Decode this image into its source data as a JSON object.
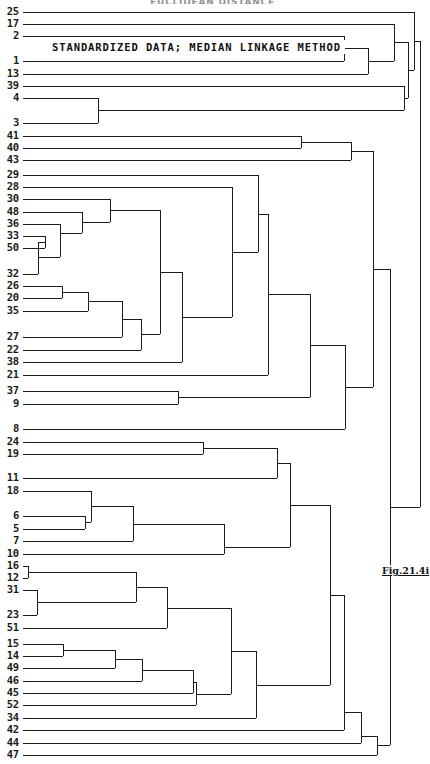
{
  "figure": {
    "top_title": "EUCLIDEAN DISTANCE",
    "subtitle": "STANDARDIZED DATA; MEDIAN LINKAGE METHOD",
    "caption": "Fig.21.4i",
    "line_color": "#1c1c1c",
    "background_color": "#ffffff",
    "text_color": "#111111"
  },
  "chart_data": {
    "type": "dendrogram",
    "title": "EUCLIDEAN DISTANCE",
    "subtitle": "STANDARDIZED DATA; MEDIAN LINKAGE METHOD",
    "xlabel": "Euclidean distance",
    "ylabel": "",
    "orientation": "horizontal",
    "linkage_method": "median",
    "data_transform": "standardized",
    "distance_metric": "euclidean",
    "grid": false,
    "legend": "none",
    "axis_ticks_shown": false,
    "leaf_count": 52,
    "leaves": [
      {
        "label": "25",
        "y": 12
      },
      {
        "label": "17",
        "y": 24
      },
      {
        "label": "2",
        "y": 36
      },
      {
        "label": "1",
        "y": 61
      },
      {
        "label": "13",
        "y": 74
      },
      {
        "label": "39",
        "y": 86
      },
      {
        "label": "4",
        "y": 98
      },
      {
        "label": "3",
        "y": 123
      },
      {
        "label": "41",
        "y": 136
      },
      {
        "label": "40",
        "y": 148
      },
      {
        "label": "43",
        "y": 160
      },
      {
        "label": "29",
        "y": 175
      },
      {
        "label": "28",
        "y": 187
      },
      {
        "label": "30",
        "y": 199
      },
      {
        "label": "48",
        "y": 212
      },
      {
        "label": "36",
        "y": 224
      },
      {
        "label": "33",
        "y": 236
      },
      {
        "label": "50",
        "y": 248
      },
      {
        "label": "32",
        "y": 274
      },
      {
        "label": "26",
        "y": 286
      },
      {
        "label": "20",
        "y": 298
      },
      {
        "label": "35",
        "y": 311
      },
      {
        "label": "27",
        "y": 337
      },
      {
        "label": "22",
        "y": 350
      },
      {
        "label": "38",
        "y": 362
      },
      {
        "label": "21",
        "y": 375
      },
      {
        "label": "37",
        "y": 391
      },
      {
        "label": "9",
        "y": 404
      },
      {
        "label": "8",
        "y": 429
      },
      {
        "label": "24",
        "y": 442
      },
      {
        "label": "19",
        "y": 454
      },
      {
        "label": "11",
        "y": 478
      },
      {
        "label": "18",
        "y": 491
      },
      {
        "label": "6",
        "y": 516
      },
      {
        "label": "5",
        "y": 529
      },
      {
        "label": "7",
        "y": 541
      },
      {
        "label": "10",
        "y": 554
      },
      {
        "label": "16",
        "y": 566
      },
      {
        "label": "12",
        "y": 578
      },
      {
        "label": "31",
        "y": 590
      },
      {
        "label": "23",
        "y": 615
      },
      {
        "label": "51",
        "y": 628
      },
      {
        "label": "15",
        "y": 644
      },
      {
        "label": "14",
        "y": 656
      },
      {
        "label": "49",
        "y": 668
      },
      {
        "label": "46",
        "y": 681
      },
      {
        "label": "45",
        "y": 693
      },
      {
        "label": "52",
        "y": 705
      },
      {
        "label": "34",
        "y": 718
      },
      {
        "label": "42",
        "y": 730
      },
      {
        "label": "44",
        "y": 743
      },
      {
        "label": "47",
        "y": 755
      }
    ],
    "leaf_stem_x": 23,
    "x_axis_range_px": [
      23,
      420
    ],
    "merges": [
      {
        "id": "m1",
        "a": "4",
        "b": "3",
        "x": 98,
        "y": 110
      },
      {
        "id": "m2",
        "a": "m1",
        "b": "39",
        "x": 404,
        "y": 98
      },
      {
        "id": "m3",
        "a": "41",
        "b": "40",
        "x": 301,
        "y": 142
      },
      {
        "id": "m4",
        "a": "m3",
        "b": "43",
        "x": 351,
        "y": 151
      },
      {
        "id": "m5",
        "a": "33",
        "b": "50",
        "x": 45,
        "y": 242
      },
      {
        "id": "m6",
        "a": "m5",
        "b": "32",
        "x": 38,
        "y": 257
      },
      {
        "id": "m7",
        "a": "36",
        "b": "m6",
        "x": 60,
        "y": 233
      },
      {
        "id": "m8",
        "a": "48",
        "b": "m7",
        "x": 82,
        "y": 222
      },
      {
        "id": "m9",
        "a": "30",
        "b": "m8",
        "x": 110,
        "y": 210
      },
      {
        "id": "m10",
        "a": "26",
        "b": "20",
        "x": 62,
        "y": 292
      },
      {
        "id": "m11",
        "a": "m10",
        "b": "35",
        "x": 88,
        "y": 301
      },
      {
        "id": "m12",
        "a": "m11",
        "b": "27",
        "x": 122,
        "y": 319
      },
      {
        "id": "m13",
        "a": "m12",
        "b": "22",
        "x": 141,
        "y": 334
      },
      {
        "id": "m14",
        "a": "m9",
        "b": "m13",
        "x": 160,
        "y": 272
      },
      {
        "id": "m15",
        "a": "m14",
        "b": "38",
        "x": 182,
        "y": 317
      },
      {
        "id": "m16",
        "a": "28",
        "b": "m15",
        "x": 232,
        "y": 252
      },
      {
        "id": "m17",
        "a": "29",
        "b": "m16",
        "x": 258,
        "y": 214
      },
      {
        "id": "m18",
        "a": "m17",
        "b": "21",
        "x": 268,
        "y": 294
      },
      {
        "id": "m19",
        "a": "37",
        "b": "9",
        "x": 178,
        "y": 397
      },
      {
        "id": "m20",
        "a": "m18",
        "b": "m19",
        "x": 310,
        "y": 345
      },
      {
        "id": "m21",
        "a": "m20",
        "b": "8",
        "x": 345,
        "y": 387
      },
      {
        "id": "m22",
        "a": "m4",
        "b": "m21",
        "x": 373,
        "y": 269
      },
      {
        "id": "m23",
        "a": "24",
        "b": "19",
        "x": 203,
        "y": 448
      },
      {
        "id": "m24",
        "a": "m23",
        "b": "11",
        "x": 277,
        "y": 463
      },
      {
        "id": "m25",
        "a": "6",
        "b": "5",
        "x": 85,
        "y": 522
      },
      {
        "id": "m26",
        "a": "m25",
        "b": "18",
        "x": 91,
        "y": 506
      },
      {
        "id": "m27",
        "a": "m26",
        "b": "7",
        "x": 133,
        "y": 524
      },
      {
        "id": "m28",
        "a": "m27",
        "b": "10",
        "x": 224,
        "y": 547
      },
      {
        "id": "m29",
        "a": "m24",
        "b": "m28",
        "x": 290,
        "y": 505
      },
      {
        "id": "m30",
        "a": "16",
        "b": "12",
        "x": 28,
        "y": 572
      },
      {
        "id": "m31",
        "a": "31",
        "b": "23",
        "x": 37,
        "y": 602
      },
      {
        "id": "m32",
        "a": "m30",
        "b": "m31",
        "x": 136,
        "y": 587
      },
      {
        "id": "m33",
        "a": "m32",
        "b": "51",
        "x": 167,
        "y": 608
      },
      {
        "id": "m34",
        "a": "15",
        "b": "14",
        "x": 63,
        "y": 650
      },
      {
        "id": "m35",
        "a": "m34",
        "b": "49",
        "x": 115,
        "y": 659
      },
      {
        "id": "m36",
        "a": "m35",
        "b": "46",
        "x": 142,
        "y": 670
      },
      {
        "id": "m37",
        "a": "m36",
        "b": "45",
        "x": 193,
        "y": 682
      },
      {
        "id": "m38",
        "a": "m37",
        "b": "52",
        "x": 196,
        "y": 694
      },
      {
        "id": "m39",
        "a": "m33",
        "b": "m38",
        "x": 231,
        "y": 651
      },
      {
        "id": "m40",
        "a": "m39",
        "b": "34",
        "x": 256,
        "y": 685
      },
      {
        "id": "m41",
        "a": "m29",
        "b": "m40",
        "x": 330,
        "y": 595
      },
      {
        "id": "m42",
        "a": "m41",
        "b": "42",
        "x": 344,
        "y": 712
      },
      {
        "id": "m43",
        "a": "m42",
        "b": "44",
        "x": 361,
        "y": 736
      },
      {
        "id": "m44",
        "a": "m43",
        "b": "47",
        "x": 377,
        "y": 745
      },
      {
        "id": "m45",
        "a": "m22",
        "b": "m44",
        "x": 390,
        "y": 507
      },
      {
        "id": "m46",
        "a": "2",
        "b": "1",
        "x": 344,
        "y": 48
      },
      {
        "id": "m47",
        "a": "m46",
        "b": "13",
        "x": 368,
        "y": 61
      },
      {
        "id": "m48",
        "a": "17",
        "b": "m47",
        "x": 394,
        "y": 42
      },
      {
        "id": "m49",
        "a": "m48",
        "b": "m2",
        "x": 408,
        "y": 70
      },
      {
        "id": "m50",
        "a": "25",
        "b": "m49",
        "x": 414,
        "y": 41
      },
      {
        "id": "m51",
        "a": "m50",
        "b": "m45",
        "x": 420,
        "y": 274
      }
    ]
  }
}
